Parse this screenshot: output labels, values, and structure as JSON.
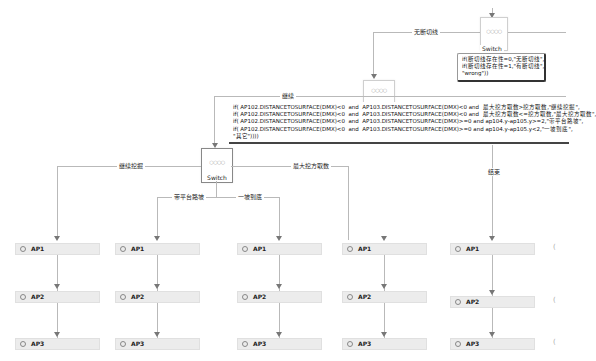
{
  "top_switch": {
    "label": "Switch",
    "dots": "○○○○",
    "expression": "if(断切线存在性=0,\"无断切线\",\nif(断切线存在性=1,\"有断切线\",\n\"wrong\"))"
  },
  "edges": {
    "no_cut": "无断切线",
    "continue": "继续",
    "continue_dig": "继续挖掘",
    "max_dig": "最大挖方取数",
    "bench_slope": "带平台路坡",
    "one_slope": "一坡到底",
    "end": "结束"
  },
  "mid_switch": {
    "dots": "○○○○",
    "expression": "if( AP102.DISTANCETOSURFACE(DMX)<0  and  AP103.DISTANCETOSURFACE(DMX)<0 and  最大挖方取数>挖方取数,\"继续挖掘\",\nif( AP102.DISTANCETOSURFACE(DMX)<0  and  AP103.DISTANCETOSURFACE(DMX)<0 and  最大挖方取数<=挖方取数,\"最大挖方取数\",\nif( AP102.DISTANCETOSURFACE(DMX)<0  and  AP103.DISTANCETOSURFACE(DMX)>=0 and ap104.y-ap105.y>=2,\"带平台路坡\",\nif( AP102.DISTANCETOSURFACE(DMX)<0  and  AP103.DISTANCETOSURFACE(DMX)>=0 and ap104.y-ap105.y<2,\"一坡到底\",\n\"其它\"))))"
  },
  "main_switch": {
    "label": "Switch",
    "dots": "○○○○"
  },
  "columns": [
    {
      "nodes": [
        "AP1",
        "AP2",
        "AP3"
      ]
    },
    {
      "nodes": [
        "AP1",
        "AP2",
        "AP3"
      ]
    },
    {
      "nodes": [
        "AP1",
        "AP2",
        "AP3"
      ]
    },
    {
      "nodes": [
        "AP1",
        "AP2",
        "AP3"
      ]
    },
    {
      "nodes": [
        "AP1",
        "AP2",
        "AP3"
      ]
    }
  ],
  "partial_glyph": "("
}
